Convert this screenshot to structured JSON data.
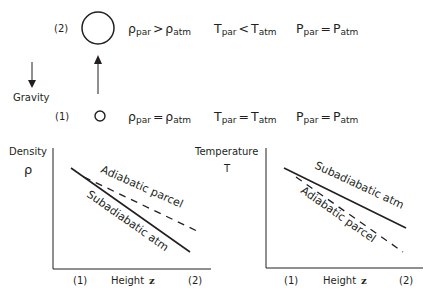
{
  "top_cutoff_text": "",
  "state2": {
    "label": "(2)",
    "rho": {
      "lhs": "ρ",
      "lhs_sub": "par",
      "op": ">",
      "rhs": "ρ",
      "rhs_sub": "atm"
    },
    "T": {
      "lhs": "T",
      "lhs_sub": "par",
      "op": "<",
      "rhs": "T",
      "rhs_sub": "atm"
    },
    "P": {
      "lhs": "P",
      "lhs_sub": "par",
      "op": "=",
      "rhs": "P",
      "rhs_sub": "atm"
    }
  },
  "state1": {
    "label": "(1)",
    "rho": {
      "lhs": "ρ",
      "lhs_sub": "par",
      "op": "=",
      "rhs": "ρ",
      "rhs_sub": "atm"
    },
    "T": {
      "lhs": "T",
      "lhs_sub": "par",
      "op": "=",
      "rhs": "T",
      "rhs_sub": "atm"
    },
    "P": {
      "lhs": "P",
      "lhs_sub": "par",
      "op": "=",
      "rhs": "P",
      "rhs_sub": "atm"
    }
  },
  "gravity_label": "Gravity",
  "density_chart": {
    "ylabel": "Density",
    "ysymbol": "ρ",
    "x_left": "(1)",
    "xlabel": "Height",
    "xsymbol": "z",
    "x_right": "(2)",
    "curve_solid_label": "Subadiabatic atm",
    "curve_dashed_label": "Adiabatic parcel"
  },
  "temperature_chart": {
    "ylabel": "Temperature",
    "ysymbol": "T",
    "x_left": "(1)",
    "xlabel": "Height",
    "xsymbol": "z",
    "x_right": "(2)",
    "curve_solid_label": "Subadiabatic atm",
    "curve_dashed_label": "Adiabatic parcel"
  },
  "colors": {
    "ink": "#231f20",
    "background": "#ffffff"
  }
}
